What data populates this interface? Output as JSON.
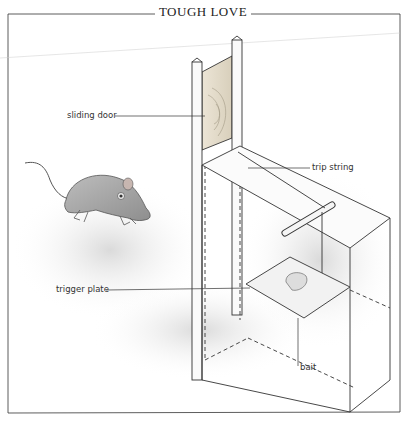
{
  "figure": {
    "title": "TOUGH LOVE",
    "labels": {
      "sliding_door": "sliding door",
      "trip_string": "trip string",
      "trigger_plate": "trigger plate",
      "bait": "bait"
    },
    "subjects": [
      "mouse-illustration",
      "box-trap-illustration"
    ]
  }
}
